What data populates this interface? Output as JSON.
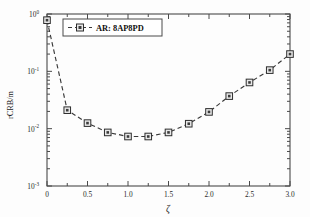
{
  "chart_data": {
    "type": "line",
    "title": "",
    "xlabel": "ζ",
    "ylabel": "rCRB/m",
    "xlim": [
      0,
      3.0
    ],
    "ylim": [
      0.001,
      1
    ],
    "yscale": "log",
    "xscale": "linear",
    "grid": false,
    "legend_position": "top-left-inside",
    "x_ticks": [
      "0",
      "0.5",
      "1.0",
      "1.5",
      "2.0",
      "2.5",
      "3.0"
    ],
    "x_tick_values": [
      0,
      0.5,
      1.0,
      1.5,
      2.0,
      2.5,
      3.0
    ],
    "y_ticks": [
      {
        "mantissa": "10",
        "exponent": "0",
        "value": 1
      },
      {
        "mantissa": "10",
        "exponent": "-1",
        "value": 0.1
      },
      {
        "mantissa": "10",
        "exponent": "-2",
        "value": 0.01
      },
      {
        "mantissa": "10",
        "exponent": "-3",
        "value": 0.001
      }
    ],
    "series": [
      {
        "name": "AR: 8AP8PD",
        "marker": "square",
        "linestyle": "dashed",
        "color": "#3a3a3a",
        "x": [
          0,
          0.25,
          0.5,
          0.75,
          1.0,
          1.25,
          1.5,
          1.75,
          2.0,
          2.25,
          2.5,
          2.75,
          3.0
        ],
        "values": [
          0.78,
          0.021,
          0.0125,
          0.0086,
          0.0073,
          0.0073,
          0.0086,
          0.0122,
          0.0196,
          0.037,
          0.064,
          0.105,
          0.2
        ]
      }
    ]
  },
  "legend": {
    "entries": [
      {
        "label": "AR: 8AP8PD"
      }
    ]
  },
  "axes": {
    "x_title": "ζ",
    "y_title": "rCRB/m"
  }
}
